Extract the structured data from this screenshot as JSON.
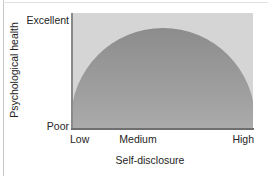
{
  "chart_data": {
    "type": "area",
    "title": "",
    "xlabel": "Self-disclosure",
    "ylabel": "Psychological health",
    "x_tick_labels": [
      "Low",
      "Medium",
      "High"
    ],
    "y_tick_labels": [
      "Poor",
      "Excellent"
    ],
    "grid": false,
    "legend": "none",
    "x": [
      0,
      0.1,
      0.2,
      0.3,
      0.4,
      0.5,
      0.6,
      0.7,
      0.8,
      0.9,
      1
    ],
    "values": [
      0.0,
      0.6,
      0.8,
      0.92,
      0.98,
      1.0,
      0.98,
      0.92,
      0.8,
      0.6,
      0.0
    ],
    "xlim": [
      0,
      1
    ],
    "ylim": [
      0,
      1
    ],
    "fill_color_top": "#8c8c8c",
    "fill_color_bottom": "#b9b9b9",
    "plot_background": "#d5d5d5",
    "axis_color": "#6f6f6f"
  },
  "ticks": {
    "y_top": "Excellent",
    "y_bottom": "Poor",
    "x_left": "Low",
    "x_mid": "Medium",
    "x_right": "High"
  },
  "axis_titles": {
    "x": "Self-disclosure",
    "y": "Psychological health"
  }
}
